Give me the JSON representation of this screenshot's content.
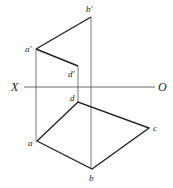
{
  "diagram": {
    "type": "orthographic projection",
    "axis": {
      "left_label": "X",
      "right_label": "O"
    },
    "front_view": {
      "points": [
        {
          "id": "a'",
          "label": "a'"
        },
        {
          "id": "b'",
          "label": "b'"
        },
        {
          "id": "d'",
          "label": "d'"
        }
      ],
      "edges": [
        [
          "a'",
          "b'"
        ],
        [
          "a'",
          "d'"
        ]
      ]
    },
    "top_view": {
      "points": [
        {
          "id": "a",
          "label": "a"
        },
        {
          "id": "b",
          "label": "b"
        },
        {
          "id": "c",
          "label": "c"
        },
        {
          "id": "d",
          "label": "d"
        }
      ],
      "edges": [
        [
          "a",
          "b"
        ],
        [
          "b",
          "c"
        ],
        [
          "c",
          "d"
        ],
        [
          "d",
          "a"
        ]
      ]
    },
    "projection_lines": [
      [
        "a'",
        "a"
      ],
      [
        "d'",
        "d"
      ],
      [
        "b'",
        "b"
      ]
    ],
    "colors": {
      "line": "#222222",
      "projector": "#555555",
      "background": "#ffffff"
    }
  }
}
